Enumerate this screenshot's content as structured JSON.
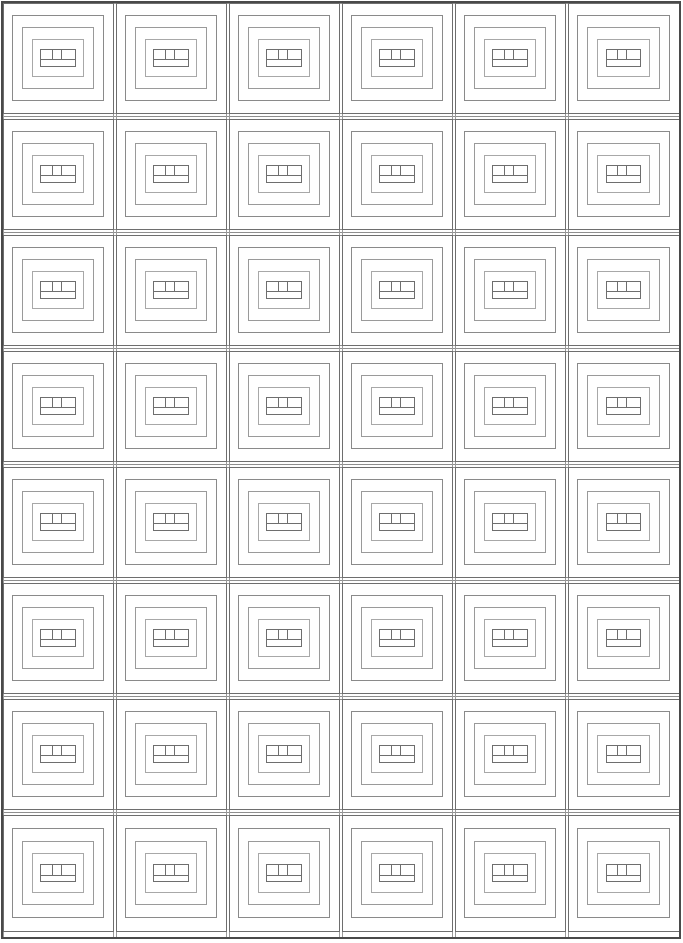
{
  "document": {
    "title": "Nested Frame Grid Pattern",
    "kind": "line-art-pattern",
    "width": 683,
    "height": 943,
    "background_color": "#ffffff"
  },
  "palette": {
    "background": "#ffffff",
    "line_dark": "#595959",
    "line_medium": "#8a8a8a",
    "line_light": "#b4b4b4",
    "line_faint": "#cccccc",
    "outer_border": "#4a4a4a"
  },
  "grid": {
    "rows": 8,
    "columns": 6,
    "total_blocks": 48,
    "outer_margin_left": 3,
    "outer_margin_right": 4,
    "outer_margin_top": 3,
    "outer_margin_bottom": 6,
    "row_pitch": 116.0,
    "column_pitch": 113.0,
    "sashing_horizontal_height": 16,
    "sashing_vertical_width": 8,
    "row_tops": [
      3,
      119,
      235,
      351,
      467,
      583,
      699,
      815
    ],
    "row_bottoms": [
      113,
      229,
      345,
      461,
      577,
      693,
      809,
      931
    ],
    "column_lefts": [
      3,
      116,
      229,
      342,
      455,
      568
    ],
    "column_rights": [
      113,
      226,
      339,
      452,
      565,
      679
    ]
  },
  "block": {
    "name": "concentric-frame-block",
    "ring_count": 4,
    "description": "Four nested rectangular rings with an inner core divided by one horizontal line and two vertical lines",
    "rings": [
      {
        "index": 0,
        "inset_x": 0,
        "inset_y": 0,
        "stroke": "#6e6e6e",
        "stroke_width": 1.0
      },
      {
        "index": 1,
        "inset_x": 0.085,
        "inset_y": 0.115,
        "stroke": "#8a8a8a",
        "stroke_width": 1.0
      },
      {
        "index": 2,
        "inset_x": 0.175,
        "inset_y": 0.225,
        "stroke": "#9a9a9a",
        "stroke_width": 1.0
      },
      {
        "index": 3,
        "inset_x": 0.265,
        "inset_y": 0.335,
        "stroke": "#a8a8a8",
        "stroke_width": 1.0
      }
    ],
    "core": {
      "inset_x": 0.345,
      "inset_y": 0.425,
      "stroke": "#6e6e6e",
      "stroke_width": 1.0,
      "horizontal_divider_fraction": 0.62,
      "vertical_divider_fractions": [
        0.34,
        0.6
      ]
    }
  },
  "sashing": {
    "horizontal_strip_lines": 2,
    "horizontal_strip_stroke": "#8f8f8f",
    "vertical_strip_stroke": "#9a9a9a",
    "note": "Two parallel horizontal rules separate each row band; single vertical rules separate columns"
  },
  "labels": {
    "pattern_name": "Concentric Frame Grid",
    "legend": "",
    "caption": ""
  }
}
